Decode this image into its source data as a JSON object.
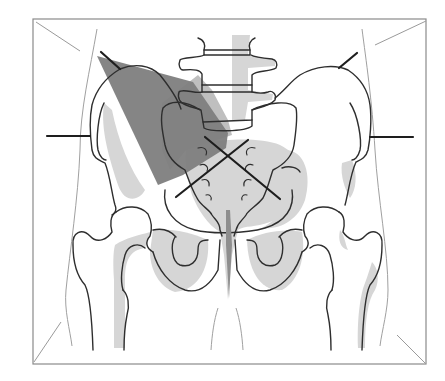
{
  "diagram": {
    "title": "Pelvis AP positioning diagram",
    "view": "anteroposterior",
    "colors": {
      "background": "#ffffff",
      "frame": "#8a8a8a",
      "outline": "#2e2e2e",
      "soft_tissue": "#9a9a9a",
      "light_shade": "#d6d6d6",
      "mid_shade": "#a9a9a9",
      "dark_shade": "#7e7e7e",
      "marker": "#1e1e1e"
    },
    "frame": {
      "x": 33,
      "y": 19,
      "width": 393,
      "height": 345
    },
    "markers": {
      "central_ray": {
        "type": "cross",
        "cx": 228,
        "cy": 158
      },
      "left_crest_tick": {
        "x1": 101,
        "y1": 52,
        "x2": 120,
        "y2": 69
      },
      "right_crest_tick": {
        "x1": 357,
        "y1": 53,
        "x2": 339,
        "y2": 68
      },
      "left_asis_line": {
        "x1": 47,
        "y1": 136,
        "x2": 90,
        "y2": 136
      },
      "right_asis_line": {
        "x1": 370,
        "y1": 137,
        "x2": 413,
        "y2": 137
      }
    },
    "structures": [
      "lumbar-vertebrae",
      "sacrum",
      "left-ilium",
      "right-ilium",
      "left-obturator-foramen",
      "right-obturator-foramen",
      "pubic-symphysis",
      "left-femur",
      "right-femur",
      "soft-tissue-outline"
    ]
  }
}
